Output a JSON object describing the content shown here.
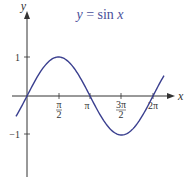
{
  "chart_data": {
    "type": "line",
    "title": "y = sin x",
    "title_parts": {
      "lhs": "y",
      "eq": " = sin ",
      "var": "x"
    },
    "xlabel": "x",
    "ylabel": "y",
    "x_ticks": [
      {
        "value": 1.5708,
        "label_num": "π",
        "label_den": "2"
      },
      {
        "value": 3.1416,
        "label": "π"
      },
      {
        "value": 4.7124,
        "label_num": "3π",
        "label_den": "2"
      },
      {
        "value": 6.2832,
        "label": "2π"
      }
    ],
    "y_ticks": [
      {
        "value": 1,
        "label": "1"
      },
      {
        "value": -1,
        "label": "−1"
      }
    ],
    "xlim": [
      -0.55,
      6.9
    ],
    "ylim": [
      -1.75,
      1.75
    ],
    "grid": false,
    "series": [
      {
        "name": "sin x",
        "x_range": [
          -0.55,
          6.83
        ],
        "function": "sin",
        "color": "#3a3f8f"
      }
    ],
    "colors": {
      "curve": "#3a3f8f",
      "axis": "#333333",
      "title": "#4a4f9a"
    }
  }
}
